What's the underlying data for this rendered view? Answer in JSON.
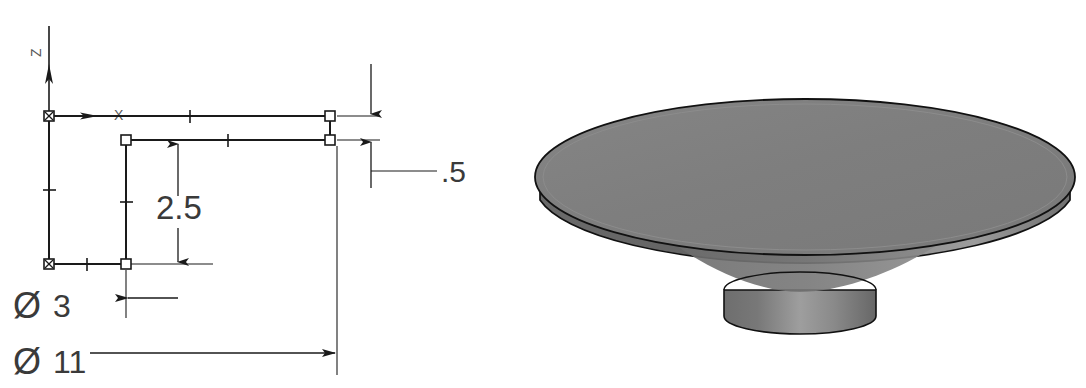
{
  "view": {
    "background_color": "#ffffff",
    "width": 1086,
    "height": 388
  },
  "sketch": {
    "title": "2D revolve profile sketch",
    "origin_label_z": "Z",
    "origin_label_x": "X",
    "line_color": "#1a1a1a",
    "dimension_color": "#3a3a3a",
    "dimensions": [
      {
        "id": "height-inner",
        "label": "2.5",
        "orientation": "vertical",
        "arrow_style": "outward"
      },
      {
        "id": "thickness",
        "label": ".5",
        "orientation": "vertical",
        "arrow_style": "outward"
      },
      {
        "id": "boss-diameter",
        "symbol": "Ø",
        "label": "3",
        "orientation": "horizontal",
        "arrow_style": "inward-left"
      },
      {
        "id": "plate-diameter",
        "symbol": "Ø",
        "label": "11",
        "orientation": "horizontal",
        "arrow_style": "inward-right"
      }
    ]
  },
  "model": {
    "title": "Shaded isometric solid model",
    "description": "Circular plate with cylindrical boss",
    "colors": {
      "top_face": "#808080",
      "rim_dark": "#666666",
      "rim_light": "#9a9a9a",
      "boss_left": "#757575",
      "boss_highlight": "#a0a0a0",
      "boss_right": "#6e6e6e",
      "outline": "#111111"
    }
  }
}
